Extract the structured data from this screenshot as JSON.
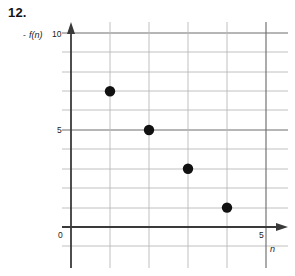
{
  "problem": {
    "number": "12."
  },
  "axes": {
    "y_label": "f(n)",
    "y_label_dash": "-",
    "x_label": "n",
    "origin_label": "0",
    "y_ticks": [
      "10",
      "5"
    ],
    "x_ticks": [
      "5"
    ],
    "y_tick_10": "10",
    "y_tick_5": "5",
    "x_tick_5": "5"
  },
  "colors": {
    "grid_minor": "#b9b9b9",
    "grid_major": "#6e6e6e",
    "axis": "#3a3a3a",
    "point": "#111111",
    "background": "#ffffff"
  },
  "chart_data": {
    "type": "scatter",
    "title": "",
    "xlabel": "n",
    "ylabel": "f(n)",
    "xlim": [
      -0.35,
      5.6
    ],
    "ylim": [
      -0.6,
      10.6
    ],
    "grid": true,
    "legend": false,
    "x_tick_labels": [
      "0",
      "5"
    ],
    "y_tick_labels": [
      "0",
      "5",
      "10"
    ],
    "x_major_ticks": [
      0,
      5
    ],
    "y_major_ticks": [
      0,
      5,
      10
    ],
    "x_minor_step": 1,
    "y_minor_step": 1,
    "x": [
      1,
      2,
      3,
      4
    ],
    "values": [
      7,
      5,
      3,
      1
    ],
    "points": [
      {
        "n": 1,
        "fn": 7
      },
      {
        "n": 2,
        "fn": 5
      },
      {
        "n": 3,
        "fn": 3
      },
      {
        "n": 4,
        "fn": 1
      }
    ],
    "series": [
      {
        "name": "f(n)",
        "values": [
          7,
          5,
          3,
          1
        ]
      }
    ],
    "categories": [
      "1",
      "2",
      "3",
      "4"
    ]
  }
}
